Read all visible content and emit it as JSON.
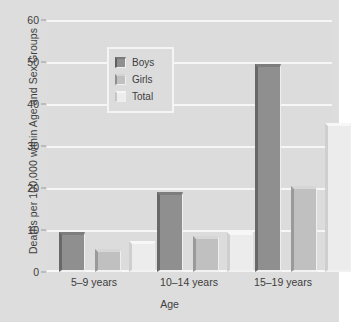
{
  "chart_data": {
    "type": "bar",
    "title": "",
    "xlabel": "Age",
    "ylabel": "Deaths per 100,000 within Age and Sex Groups",
    "categories": [
      "5–9 years",
      "10–14 years",
      "15–19 years"
    ],
    "series": [
      {
        "name": "Boys",
        "values": [
          9.5,
          19.0,
          49.5
        ],
        "color": "#8f8f8f"
      },
      {
        "name": "Girls",
        "values": [
          5.5,
          8.5,
          20.5
        ],
        "color": "#c0c0c0"
      },
      {
        "name": "Total",
        "values": [
          7.5,
          9.5,
          35.5
        ],
        "color": "#ececec"
      }
    ],
    "ylim": [
      0,
      60
    ],
    "yticks": [
      0,
      10,
      20,
      30,
      40,
      50,
      60
    ],
    "grid": "horizontal-only",
    "legend_position": "top-left-inside",
    "plot_background": "#dcdcdc",
    "gridline_color": "#f6f6f6"
  },
  "axes": {
    "y_title": "Deaths per 100,000 within Age and Sex Groups",
    "x_title": "Age",
    "y_tick_labels": [
      "0",
      "10",
      "20",
      "30",
      "40",
      "50",
      "60"
    ],
    "x_tick_labels": [
      "5–9 years",
      "10–14 years",
      "15–19 years"
    ]
  },
  "legend": {
    "items": [
      {
        "label": "Boys"
      },
      {
        "label": "Girls"
      },
      {
        "label": "Total"
      }
    ]
  }
}
